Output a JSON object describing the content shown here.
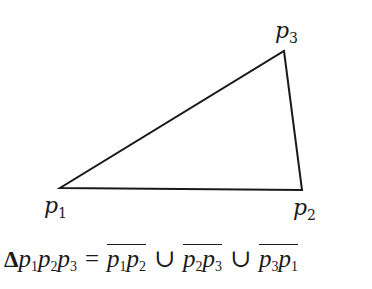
{
  "diagram": {
    "type": "triangle",
    "stroke_color": "#1a1a1a",
    "vertices": [
      {
        "id": "p1",
        "name": "p",
        "sub": "1",
        "x": 60,
        "y": 188
      },
      {
        "id": "p2",
        "name": "p",
        "sub": "2",
        "x": 302,
        "y": 190
      },
      {
        "id": "p3",
        "name": "p",
        "sub": "3",
        "x": 284,
        "y": 51
      }
    ],
    "edges": [
      [
        "p1",
        "p2"
      ],
      [
        "p2",
        "p3"
      ],
      [
        "p3",
        "p1"
      ]
    ]
  },
  "labels": {
    "p1": {
      "base": "p",
      "sub": "1"
    },
    "p2": {
      "base": "p",
      "sub": "2"
    },
    "p3": {
      "base": "p",
      "sub": "3"
    }
  },
  "formula": {
    "delta": "Δ",
    "lhs": [
      {
        "base": "p",
        "sub": "1"
      },
      {
        "base": "p",
        "sub": "2"
      },
      {
        "base": "p",
        "sub": "3"
      }
    ],
    "equals": "=",
    "union": "∪",
    "segments": [
      {
        "a": {
          "base": "p",
          "sub": "1"
        },
        "b": {
          "base": "p",
          "sub": "2"
        }
      },
      {
        "a": {
          "base": "p",
          "sub": "2"
        },
        "b": {
          "base": "p",
          "sub": "3"
        }
      },
      {
        "a": {
          "base": "p",
          "sub": "3"
        },
        "b": {
          "base": "p",
          "sub": "1"
        }
      }
    ],
    "plain_text": "Δp1p2p3 = p1p2 ∪ p2p3 ∪ p3p1"
  }
}
